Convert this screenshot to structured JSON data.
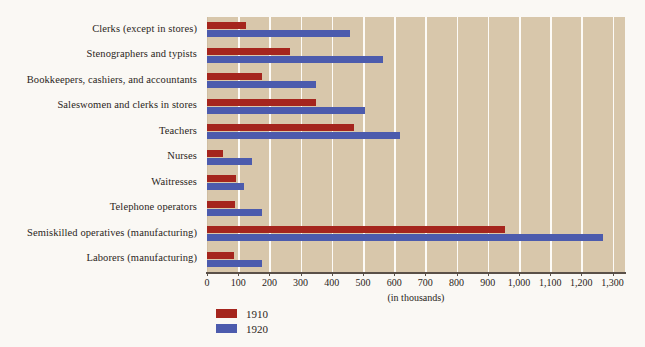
{
  "chart_data": {
    "type": "bar",
    "orientation": "horizontal",
    "title": "",
    "xlabel": "(in thousands)",
    "ylabel": "",
    "xlim": [
      0,
      1340
    ],
    "grid": true,
    "legend_position": "bottom-left",
    "xticks": [
      0,
      100,
      200,
      300,
      400,
      500,
      600,
      700,
      800,
      900,
      1000,
      1100,
      1200,
      1300
    ],
    "xtick_labels": [
      "0",
      "100",
      "200",
      "300",
      "400",
      "500",
      "600",
      "700",
      "800",
      "900",
      "1,000",
      "1,100",
      "1,200",
      "1,300"
    ],
    "categories": [
      "Clerks (except in stores)",
      "Stenographers and typists",
      "Bookkeepers, cashiers, and accountants",
      "Saleswomen and clerks in stores",
      "Teachers",
      "Nurses",
      "Waitresses",
      "Telephone operators",
      "Semiskilled operatives (manufacturing)",
      "Laborers (manufacturing)"
    ],
    "series": [
      {
        "name": "1910",
        "color": "#a5251d",
        "values": [
          125,
          265,
          175,
          350,
          470,
          50,
          92,
          90,
          955,
          85
        ]
      },
      {
        "name": "1920",
        "color": "#4c5bad",
        "values": [
          460,
          565,
          350,
          505,
          620,
          143,
          120,
          175,
          1270,
          175
        ]
      }
    ]
  },
  "colors": {
    "series_1910": "#a5251d",
    "series_1920": "#4c5bad",
    "plot_background": "#d8c7ab",
    "gridline": "#fdfbf7",
    "page_background": "#faf8f4",
    "axis": "#5a5048",
    "text": "#2a2521"
  },
  "axis": {
    "caption": "(in thousands)"
  },
  "legend": {
    "items": [
      {
        "label": "1910",
        "color": "#a5251d"
      },
      {
        "label": "1920",
        "color": "#4c5bad"
      }
    ]
  }
}
